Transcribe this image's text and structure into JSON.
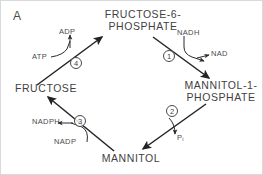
{
  "figure": {
    "panel_letter": "A",
    "title_visible": false,
    "background_color": "#ffffff",
    "line_color": "#2b2b2b",
    "text_color": "#4a4a4a"
  },
  "metabolites": [
    {
      "id": "fructose-6-phosphate",
      "line1": "FRUCTOSE-6-",
      "line2": "PHOSPHATE"
    },
    {
      "id": "mannitol-1-phosphate",
      "line1": "MANNITOL-1-",
      "line2": "PHOSPHATE"
    },
    {
      "id": "mannitol",
      "line1": "MANNITOL",
      "line2": ""
    },
    {
      "id": "fructose",
      "line1": "FRUCTOSE",
      "line2": ""
    }
  ],
  "steps": [
    {
      "number": "1",
      "from": "fructose-6-phosphate",
      "to": "mannitol-1-phosphate",
      "consumes": "NADH",
      "produces": "NAD"
    },
    {
      "number": "2",
      "from": "mannitol-1-phosphate",
      "to": "mannitol",
      "consumes": "",
      "produces": "Pi"
    },
    {
      "number": "3",
      "from": "mannitol",
      "to": "fructose",
      "consumes": "NADP",
      "produces": "NADPH"
    },
    {
      "number": "4",
      "from": "fructose",
      "to": "fructose-6-phosphate",
      "consumes": "ATP",
      "produces": "ADP"
    }
  ],
  "cofactors": {
    "nadh": "NADH",
    "nad": "NAD",
    "pi_symbol": "P",
    "pi_subscript": "i",
    "nadph": "NADPH",
    "nadp": "NADP",
    "atp": "ATP",
    "adp": "ADP"
  }
}
